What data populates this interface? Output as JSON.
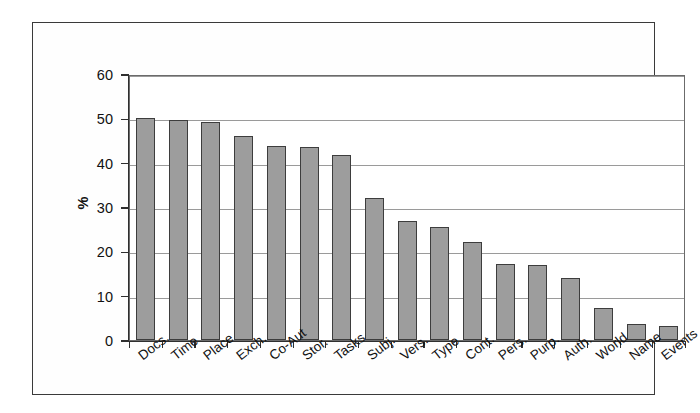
{
  "chart_data": {
    "type": "bar",
    "title": "",
    "subtitle": "",
    "xlabel": "",
    "ylabel": "%",
    "ylim": [
      0,
      60
    ],
    "ytick_step": 10,
    "yticks": [
      60,
      50,
      40,
      30,
      20,
      10,
      0
    ],
    "grid": true,
    "grid_axis": "y",
    "legend": false,
    "legend_position": "none",
    "bar_color": "#9d9d9d",
    "bar_border_color": "#3d3d3d",
    "categories": [
      "Docs.",
      "Time",
      "Place",
      "Exch.",
      "Co-Aut",
      "Stor.",
      "Tasks",
      "Subj.",
      "Vers.",
      "Type",
      "Cont.",
      "Pers.",
      "Purp.",
      "Auth.",
      "World",
      "Name",
      "Events"
    ],
    "values": [
      50.0,
      49.6,
      49.1,
      46.0,
      43.7,
      43.6,
      41.8,
      32.0,
      26.9,
      25.5,
      22.1,
      17.2,
      17.0,
      14.0,
      7.3,
      3.6,
      3.2
    ]
  },
  "axis": {
    "y_title": "%"
  }
}
